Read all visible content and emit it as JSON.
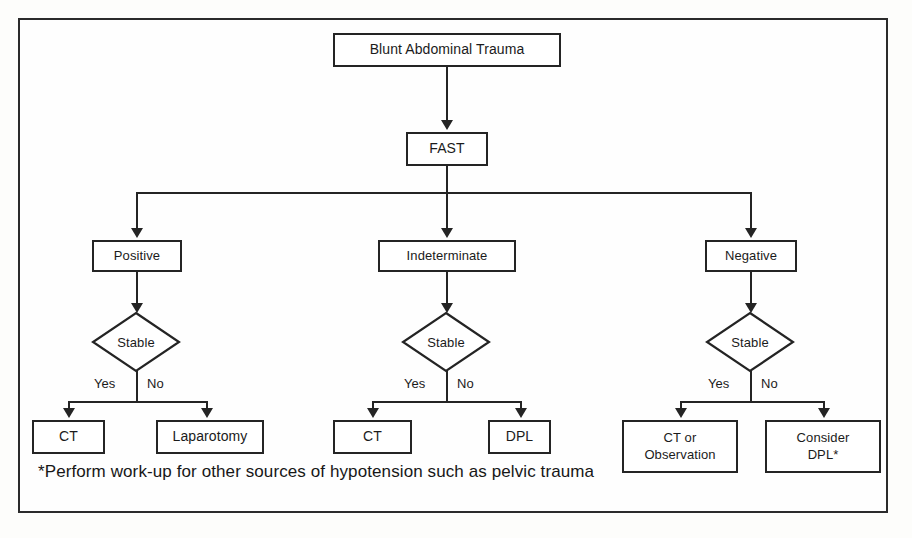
{
  "diagram": {
    "title_node": "Blunt Abdominal Trauma",
    "test_node": "FAST",
    "branches": [
      {
        "result": "Positive",
        "decision": "Stable",
        "yes_label": "Yes",
        "no_label": "No",
        "yes_outcome": "CT",
        "no_outcome": "Laparotomy"
      },
      {
        "result": "Indeterminate",
        "decision": "Stable",
        "yes_label": "Yes",
        "no_label": "No",
        "yes_outcome": "CT",
        "no_outcome": "DPL"
      },
      {
        "result": "Negative",
        "decision": "Stable",
        "yes_label": "Yes",
        "no_label": "No",
        "yes_outcome_line1": "CT or",
        "yes_outcome_line2": "Observation",
        "no_outcome_line1": "Consider",
        "no_outcome_line2": "DPL*"
      }
    ],
    "footnote": "*Perform work-up for other sources of hypotension such as pelvic trauma",
    "colors": {
      "line": "#242424",
      "text": "#1b1b1b",
      "background": "#fefefe",
      "frame": "#2b2b2b"
    }
  }
}
